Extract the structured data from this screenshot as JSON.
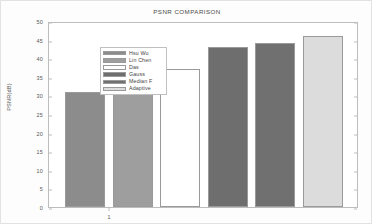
{
  "figure": {
    "background_color": "#fdfdfd",
    "axes_color": "#bdbdbd"
  },
  "chart_data": {
    "type": "bar",
    "title": "PSNR COMPARISON",
    "xlabel": "",
    "ylabel": "PSNR(dB)",
    "categories": [
      "Hsu Wu",
      "Lin Chen",
      "Das",
      "Gauss",
      "Median F",
      "Adaptive"
    ],
    "values": [
      31,
      34,
      37,
      43,
      44,
      46
    ],
    "colors": [
      "#8c8c8c",
      "#9e9e9e",
      "#ffffff",
      "#6e6e6e",
      "#707070",
      "#dcdcdc"
    ],
    "ylim": [
      0,
      50
    ],
    "yticks": [
      0,
      5,
      10,
      15,
      20,
      25,
      30,
      35,
      40,
      45,
      50
    ],
    "ytick_labels": [
      "0",
      "5",
      "10",
      "15",
      "20",
      "25",
      "30",
      "35",
      "40",
      "45",
      "50"
    ],
    "xticks": [
      1
    ],
    "xtick_labels": [
      "1"
    ],
    "grid": false,
    "legend_position": "upper left",
    "legend_entries": [
      {
        "label": "Hsu Wu",
        "color": "#8c8c8c"
      },
      {
        "label": "Lin Chen",
        "color": "#9e9e9e"
      },
      {
        "label": "Das",
        "color": "#ffffff"
      },
      {
        "label": "Gauss",
        "color": "#6e6e6e"
      },
      {
        "label": "Median F",
        "color": "#707070"
      },
      {
        "label": "Adaptive",
        "color": "#dcdcdc"
      }
    ]
  }
}
